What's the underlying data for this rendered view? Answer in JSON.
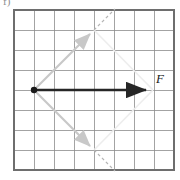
{
  "figure": {
    "part_label": "f)",
    "grid": {
      "columns": 8,
      "rows": 8,
      "left": 14,
      "top": 10,
      "cell": 20,
      "line_color": "#8c8c8c",
      "border_color": "#6e6e6e"
    },
    "vectors": [
      {
        "name": "resultant-force",
        "label": "F",
        "color": "#262626",
        "style": "solid",
        "origin_cell": [
          1,
          4
        ],
        "tip_cell": [
          8,
          4
        ],
        "x1": 34,
        "y1": 90,
        "x2": 153,
        "y2": 90,
        "has_origin_dot": true
      },
      {
        "name": "component-up-right",
        "label": "",
        "color": "#c8c8c8",
        "style": "solid",
        "origin_cell": [
          1,
          4
        ],
        "tip_cell": [
          4,
          1
        ],
        "x1": 34,
        "y1": 90,
        "x2": 94,
        "y2": 30
      },
      {
        "name": "component-down-right",
        "label": "",
        "color": "#c8c8c8",
        "style": "solid",
        "origin_cell": [
          1,
          4
        ],
        "tip_cell": [
          4,
          7
        ],
        "x1": 34,
        "y1": 90,
        "x2": 94,
        "y2": 150
      }
    ],
    "construction_lines": [
      {
        "name": "dashed-upper-continuation",
        "color": "#b4b4b4",
        "style": "dashed",
        "x1": 94,
        "y1": 30,
        "x2": 114,
        "y2": 10
      },
      {
        "name": "dashed-lower-continuation",
        "color": "#b4b4b4",
        "style": "dashed",
        "x1": 94,
        "y1": 150,
        "x2": 114,
        "y2": 170
      },
      {
        "name": "faint-parallel-upper",
        "color": "#ededed",
        "style": "solid",
        "x1": 94,
        "y1": 30,
        "x2": 153,
        "y2": 90
      },
      {
        "name": "faint-parallel-lower",
        "color": "#ededed",
        "style": "solid",
        "x1": 94,
        "y1": 150,
        "x2": 153,
        "y2": 90
      }
    ],
    "colors": {
      "vector_dark": "#262626",
      "vector_gray": "#c8c8c8",
      "dashed_gray": "#b4b4b4",
      "grid_gray": "#8c8c8c",
      "background": "#ffffff"
    }
  }
}
